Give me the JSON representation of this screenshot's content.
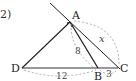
{
  "problem": {
    "number": "2)"
  },
  "points": {
    "A": {
      "label": "A",
      "x": 70,
      "y": 22
    },
    "B": {
      "label": "B",
      "x": 98,
      "y": 68
    },
    "C": {
      "label": "C",
      "x": 118,
      "y": 68
    },
    "D": {
      "label": "D",
      "x": 22,
      "y": 68
    }
  },
  "measurements": {
    "AB": "8",
    "DB": "12",
    "BC": "3",
    "AC": "x"
  },
  "colors": {
    "line": "#222222",
    "dashed": "#999999"
  }
}
